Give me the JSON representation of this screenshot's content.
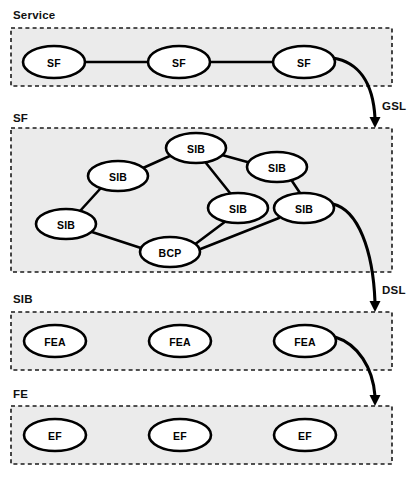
{
  "diagram": {
    "type": "layered-node-graph",
    "canvas": {
      "width": 418,
      "height": 481
    },
    "colors": {
      "layer_fill": "#ebebeb",
      "layer_border": "#1a1a1a",
      "node_fill": "#ffffff",
      "node_border": "#000000",
      "edge": "#000000",
      "text": "#000000"
    },
    "layers": [
      {
        "id": "service",
        "label": "Service",
        "box": {
          "x": 11,
          "y": 28,
          "w": 381,
          "h": 58
        },
        "label_pos": {
          "x": 13,
          "y": 19
        },
        "nodes": [
          {
            "id": "sf-1",
            "label": "SF",
            "cx": 54,
            "cy": 62,
            "rx": 31,
            "ry": 16
          },
          {
            "id": "sf-2",
            "label": "SF",
            "cx": 179,
            "cy": 62,
            "rx": 31,
            "ry": 16
          },
          {
            "id": "sf-3",
            "label": "SF",
            "cx": 304,
            "cy": 62,
            "rx": 31,
            "ry": 16
          }
        ],
        "edges": [
          {
            "from": "sf-1",
            "to": "sf-2",
            "x1": 85,
            "y1": 62,
            "x2": 148,
            "y2": 62
          },
          {
            "from": "sf-2",
            "to": "sf-3",
            "x1": 210,
            "y1": 62,
            "x2": 273,
            "y2": 62
          }
        ]
      },
      {
        "id": "sf",
        "label": "SF",
        "box": {
          "x": 11,
          "y": 128,
          "w": 381,
          "h": 144
        },
        "label_pos": {
          "x": 13,
          "y": 122
        },
        "nodes": [
          {
            "id": "sib-top",
            "label": "SIB",
            "cx": 196,
            "cy": 148,
            "rx": 30,
            "ry": 15
          },
          {
            "id": "sib-upper-left",
            "label": "SIB",
            "cx": 118,
            "cy": 176,
            "rx": 30,
            "ry": 15
          },
          {
            "id": "sib-upper-right",
            "label": "SIB",
            "cx": 277,
            "cy": 167,
            "rx": 30,
            "ry": 15
          },
          {
            "id": "sib-mid",
            "label": "SIB",
            "cx": 238,
            "cy": 208,
            "rx": 30,
            "ry": 15
          },
          {
            "id": "sib-right",
            "label": "SIB",
            "cx": 304,
            "cy": 208,
            "rx": 30,
            "ry": 15
          },
          {
            "id": "sib-left",
            "label": "SIB",
            "cx": 66,
            "cy": 224,
            "rx": 30,
            "ry": 15
          },
          {
            "id": "bcp",
            "label": "BCP",
            "cx": 170,
            "cy": 252,
            "rx": 30,
            "ry": 15
          }
        ],
        "edges": [
          {
            "from": "sib-upper-left",
            "to": "sib-top",
            "x1": 143,
            "y1": 168,
            "x2": 172,
            "y2": 155
          },
          {
            "from": "sib-top",
            "to": "sib-upper-right",
            "x1": 222,
            "y1": 155,
            "x2": 251,
            "y2": 163
          },
          {
            "from": "sib-top",
            "to": "sib-mid",
            "x1": 206,
            "y1": 163,
            "x2": 230,
            "y2": 193
          },
          {
            "from": "sib-upper-right",
            "to": "sib-right",
            "x1": 292,
            "y1": 181,
            "x2": 300,
            "y2": 193
          },
          {
            "from": "sib-upper-left",
            "to": "sib-left",
            "x1": 100,
            "y1": 189,
            "x2": 80,
            "y2": 211
          },
          {
            "from": "sib-left",
            "to": "bcp",
            "x1": 92,
            "y1": 232,
            "x2": 144,
            "y2": 249
          },
          {
            "from": "bcp",
            "to": "sib-mid",
            "x1": 194,
            "y1": 245,
            "x2": 226,
            "y2": 221
          },
          {
            "from": "bcp",
            "to": "sib-right",
            "x1": 198,
            "y1": 250,
            "x2": 279,
            "y2": 218
          }
        ]
      },
      {
        "id": "sib",
        "label": "SIB",
        "box": {
          "x": 11,
          "y": 312,
          "w": 381,
          "h": 58
        },
        "label_pos": {
          "x": 13,
          "y": 303
        },
        "nodes": [
          {
            "id": "fea-1",
            "label": "FEA",
            "cx": 55,
            "cy": 341,
            "rx": 31,
            "ry": 16
          },
          {
            "id": "fea-2",
            "label": "FEA",
            "cx": 180,
            "cy": 341,
            "rx": 31,
            "ry": 16
          },
          {
            "id": "fea-3",
            "label": "FEA",
            "cx": 305,
            "cy": 341,
            "rx": 31,
            "ry": 16
          }
        ],
        "edges": []
      },
      {
        "id": "fe",
        "label": "FE",
        "box": {
          "x": 11,
          "y": 406,
          "w": 381,
          "h": 58
        },
        "label_pos": {
          "x": 13,
          "y": 398
        },
        "nodes": [
          {
            "id": "ef-1",
            "label": "EF",
            "cx": 55,
            "cy": 435,
            "rx": 31,
            "ry": 16
          },
          {
            "id": "ef-2",
            "label": "EF",
            "cx": 180,
            "cy": 435,
            "rx": 31,
            "ry": 16
          },
          {
            "id": "ef-3",
            "label": "EF",
            "cx": 305,
            "cy": 435,
            "rx": 31,
            "ry": 16
          }
        ],
        "edges": []
      }
    ],
    "flows": [
      {
        "id": "gsl",
        "label": "GSL",
        "label_pos": {
          "x": 382,
          "y": 110
        },
        "path": "M 333 58 C 358 62 373 82 375 118",
        "head": {
          "x": 375,
          "y": 128
        }
      },
      {
        "id": "dsl",
        "label": "DSL",
        "label_pos": {
          "x": 382,
          "y": 294
        },
        "path": "M 333 204 C 358 210 373 250 375 302",
        "head": {
          "x": 375,
          "y": 312
        }
      },
      {
        "id": "fea-to-fe",
        "label": "",
        "path": "M 335 337 C 358 344 373 368 375 396",
        "head": {
          "x": 375,
          "y": 406
        }
      }
    ]
  }
}
